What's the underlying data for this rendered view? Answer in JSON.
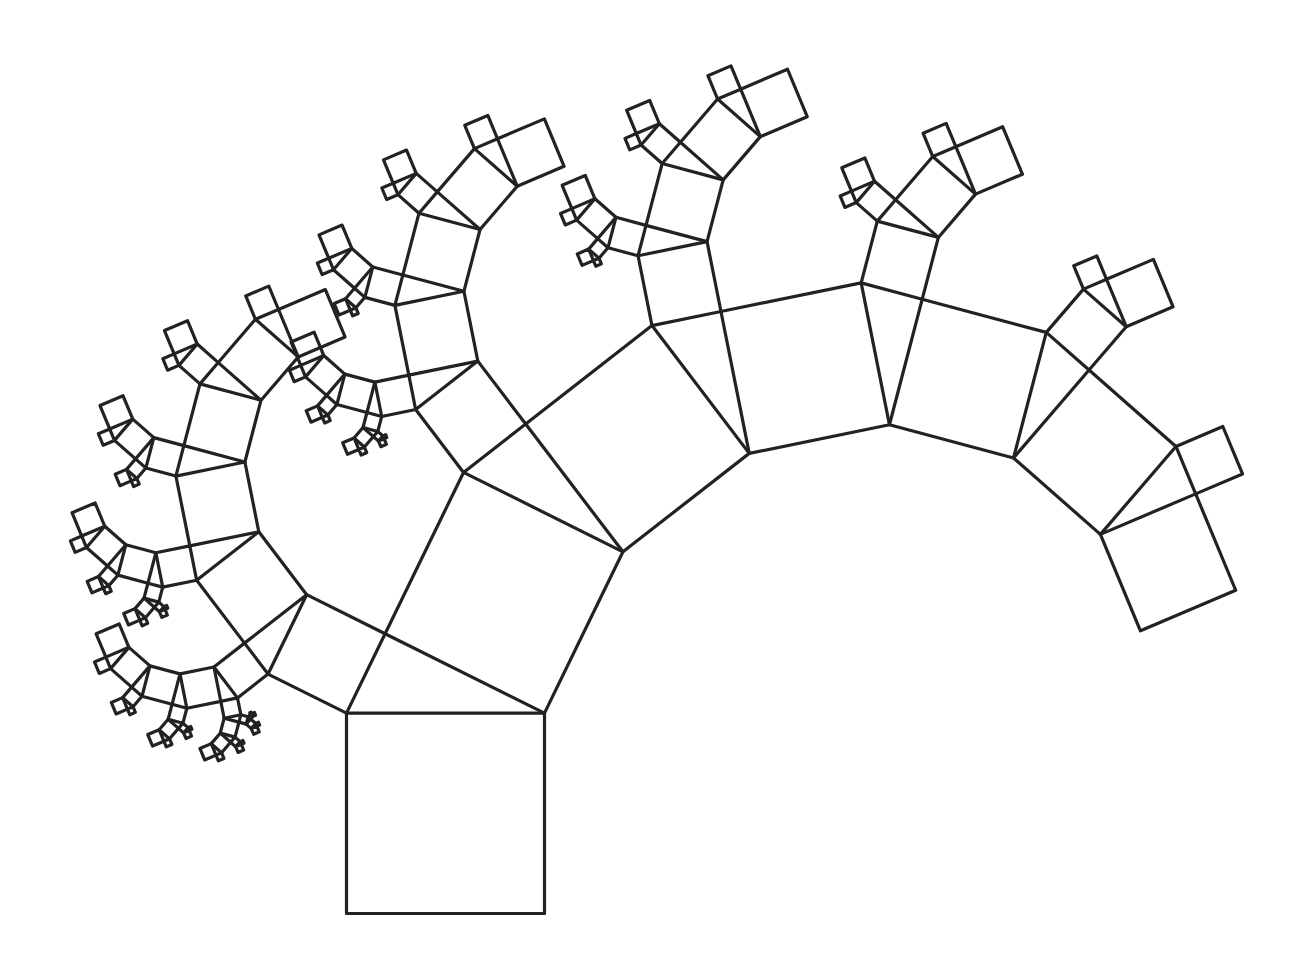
{
  "figure": {
    "title": "Pythagoras tree",
    "type": "fractal",
    "background": "#ffffff",
    "stroke_color": "#222222",
    "stroke_width": 3.2
  },
  "tree": {
    "base_square": {
      "bottom_left": [
        346.5,
        913.5
      ],
      "bottom_right": [
        544.5,
        913.5
      ],
      "scale_x": 1.0,
      "scale_y": 1.012
    },
    "angle_degrees": 63.8,
    "max_depth": 6,
    "left_child_ratio": "cos(angle)",
    "right_child_ratio": "sin(angle)"
  }
}
